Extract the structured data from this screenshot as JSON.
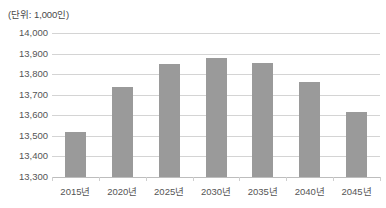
{
  "unit_note": "(단위: 1,000인)",
  "chart_data": {
    "type": "bar",
    "title": "",
    "subtitle": "",
    "unit_label": "(단위: 1,000인)",
    "xlabel": "",
    "ylabel": "",
    "categories": [
      "2015년",
      "2020년",
      "2025년",
      "2030년",
      "2035년",
      "2040년",
      "2045년"
    ],
    "values": [
      13520,
      13737,
      13848,
      13878,
      13856,
      13762,
      13615
    ],
    "series": [
      {
        "name": "인구",
        "values": [
          13520,
          13737,
          13848,
          13878,
          13856,
          13762,
          13615
        ],
        "color": "#9a9a9a"
      }
    ],
    "ylim": [
      13300,
      14000
    ],
    "ytick_step": 100,
    "ytick_labels": [
      "14,000",
      "13,900",
      "13,800",
      "13,700",
      "13,600",
      "13,500",
      "13,400",
      "13,300"
    ],
    "ytick_values": [
      14000,
      13900,
      13800,
      13700,
      13600,
      13500,
      13400,
      13300
    ],
    "grid": true,
    "legend": false,
    "legend_position": "none",
    "bar_color": "#9a9a9a",
    "gridline_color": "#d4d4d4",
    "axis_color": "#bdbdbd",
    "annotations": []
  }
}
